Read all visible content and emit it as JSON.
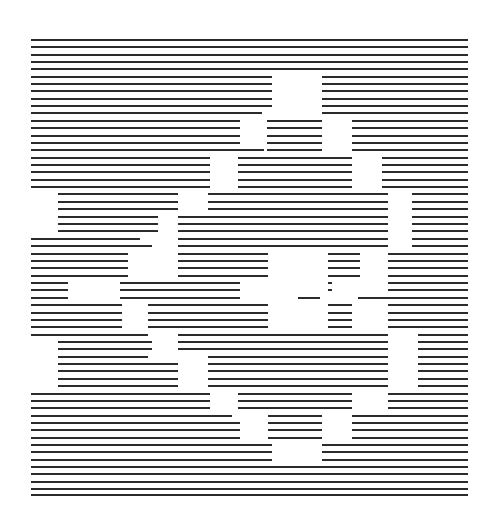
{
  "artwork": {
    "title": "Horizontal Line Field",
    "medium": "generative line drawing",
    "type": "abstract-line-raster",
    "description": "A field of evenly spaced horizontal ink rules spanning a square region, interrupted by rectangular voids aligned to an underlying grid, producing a blocky positive/negative pattern.",
    "background_color": "#ffffff",
    "line_color": "#2b2b2b",
    "canvas": {
      "width": 498,
      "height": 521
    }
  },
  "line_field": {
    "left_margin": 31,
    "right_margin": 468,
    "top_line_y": 40,
    "bottom_line_y": 495,
    "line_count": 63,
    "line_spacing": 7.34,
    "stroke_width": 1.55,
    "grid_column_step": 50,
    "grid_origin_x": 31,
    "rows": [
      {
        "y": 40,
        "spans": [
          [
            31,
            468
          ]
        ]
      },
      {
        "y": 47,
        "spans": [
          [
            31,
            468
          ]
        ]
      },
      {
        "y": 55,
        "spans": [
          [
            31,
            468
          ]
        ]
      },
      {
        "y": 62,
        "spans": [
          [
            31,
            468
          ]
        ]
      },
      {
        "y": 69,
        "spans": [
          [
            31,
            468
          ]
        ]
      },
      {
        "y": 77,
        "spans": [
          [
            31,
            272
          ],
          [
            322,
            468
          ]
        ]
      },
      {
        "y": 84,
        "spans": [
          [
            31,
            272
          ],
          [
            322,
            468
          ]
        ]
      },
      {
        "y": 91,
        "spans": [
          [
            31,
            272
          ],
          [
            322,
            468
          ]
        ]
      },
      {
        "y": 99,
        "spans": [
          [
            31,
            272
          ],
          [
            322,
            468
          ]
        ]
      },
      {
        "y": 106,
        "spans": [
          [
            31,
            272
          ],
          [
            322,
            468
          ]
        ]
      },
      {
        "y": 113,
        "spans": [
          [
            31,
            262
          ],
          [
            322,
            468
          ]
        ]
      },
      {
        "y": 121,
        "spans": [
          [
            31,
            240
          ],
          [
            267,
            322
          ],
          [
            352,
            468
          ]
        ]
      },
      {
        "y": 128,
        "spans": [
          [
            31,
            240
          ],
          [
            267,
            322
          ],
          [
            352,
            468
          ]
        ]
      },
      {
        "y": 136,
        "spans": [
          [
            31,
            240
          ],
          [
            267,
            322
          ],
          [
            352,
            468
          ]
        ]
      },
      {
        "y": 143,
        "spans": [
          [
            31,
            240
          ],
          [
            267,
            322
          ],
          [
            352,
            468
          ]
        ]
      },
      {
        "y": 150,
        "spans": [
          [
            31,
            264
          ],
          [
            267,
            322
          ],
          [
            352,
            468
          ]
        ]
      },
      {
        "y": 158,
        "spans": [
          [
            31,
            210
          ],
          [
            238,
            352
          ],
          [
            382,
            468
          ]
        ]
      },
      {
        "y": 165,
        "spans": [
          [
            31,
            210
          ],
          [
            238,
            352
          ],
          [
            382,
            468
          ]
        ]
      },
      {
        "y": 172,
        "spans": [
          [
            31,
            210
          ],
          [
            238,
            352
          ],
          [
            382,
            468
          ]
        ]
      },
      {
        "y": 180,
        "spans": [
          [
            31,
            210
          ],
          [
            238,
            352
          ],
          [
            382,
            468
          ]
        ]
      },
      {
        "y": 187,
        "spans": [
          [
            31,
            210
          ],
          [
            238,
            352
          ],
          [
            382,
            468
          ]
        ]
      },
      {
        "y": 194,
        "spans": [
          [
            58,
            178
          ],
          [
            208,
            388
          ],
          [
            412,
            468
          ]
        ]
      },
      {
        "y": 202,
        "spans": [
          [
            58,
            178
          ],
          [
            208,
            388
          ],
          [
            412,
            468
          ]
        ]
      },
      {
        "y": 209,
        "spans": [
          [
            58,
            178
          ],
          [
            208,
            388
          ],
          [
            412,
            468
          ]
        ]
      },
      {
        "y": 217,
        "spans": [
          [
            58,
            158
          ],
          [
            178,
            388
          ],
          [
            412,
            468
          ]
        ]
      },
      {
        "y": 224,
        "spans": [
          [
            58,
            158
          ],
          [
            178,
            388
          ],
          [
            412,
            468
          ]
        ]
      },
      {
        "y": 231,
        "spans": [
          [
            58,
            158
          ],
          [
            178,
            388
          ],
          [
            412,
            468
          ]
        ]
      },
      {
        "y": 239,
        "spans": [
          [
            31,
            140
          ],
          [
            178,
            388
          ],
          [
            412,
            468
          ]
        ]
      },
      {
        "y": 246,
        "spans": [
          [
            31,
            152
          ],
          [
            178,
            388
          ],
          [
            412,
            468
          ]
        ]
      },
      {
        "y": 254,
        "spans": [
          [
            31,
            128
          ],
          [
            178,
            268
          ],
          [
            328,
            360
          ],
          [
            388,
            468
          ]
        ]
      },
      {
        "y": 261,
        "spans": [
          [
            31,
            128
          ],
          [
            178,
            268
          ],
          [
            328,
            360
          ],
          [
            388,
            468
          ]
        ]
      },
      {
        "y": 268,
        "spans": [
          [
            31,
            128
          ],
          [
            178,
            268
          ],
          [
            328,
            360
          ],
          [
            388,
            468
          ]
        ]
      },
      {
        "y": 276,
        "spans": [
          [
            31,
            128
          ],
          [
            178,
            268
          ],
          [
            328,
            360
          ],
          [
            388,
            468
          ]
        ]
      },
      {
        "y": 283,
        "spans": [
          [
            31,
            68
          ],
          [
            120,
            240
          ],
          [
            328,
            332
          ],
          [
            388,
            468
          ]
        ]
      },
      {
        "y": 290,
        "spans": [
          [
            31,
            68
          ],
          [
            120,
            240
          ],
          [
            328,
            332
          ],
          [
            388,
            468
          ]
        ]
      },
      {
        "y": 298,
        "spans": [
          [
            31,
            68
          ],
          [
            120,
            240
          ],
          [
            298,
            320
          ],
          [
            358,
            468
          ]
        ]
      },
      {
        "y": 305,
        "spans": [
          [
            31,
            122
          ],
          [
            148,
            268
          ],
          [
            328,
            352
          ],
          [
            388,
            468
          ]
        ]
      },
      {
        "y": 313,
        "spans": [
          [
            31,
            122
          ],
          [
            148,
            268
          ],
          [
            328,
            352
          ],
          [
            388,
            468
          ]
        ]
      },
      {
        "y": 320,
        "spans": [
          [
            31,
            122
          ],
          [
            148,
            268
          ],
          [
            328,
            352
          ],
          [
            388,
            468
          ]
        ]
      },
      {
        "y": 327,
        "spans": [
          [
            31,
            122
          ],
          [
            148,
            268
          ],
          [
            328,
            352
          ],
          [
            388,
            468
          ]
        ]
      },
      {
        "y": 335,
        "spans": [
          [
            31,
            148
          ],
          [
            178,
            388
          ],
          [
            418,
            468
          ]
        ]
      },
      {
        "y": 342,
        "spans": [
          [
            58,
            152
          ],
          [
            178,
            388
          ],
          [
            418,
            468
          ]
        ]
      },
      {
        "y": 349,
        "spans": [
          [
            58,
            152
          ],
          [
            178,
            388
          ],
          [
            418,
            468
          ]
        ]
      },
      {
        "y": 357,
        "spans": [
          [
            58,
            148
          ],
          [
            208,
            388
          ],
          [
            418,
            468
          ]
        ]
      },
      {
        "y": 364,
        "spans": [
          [
            58,
            178
          ],
          [
            208,
            388
          ],
          [
            418,
            468
          ]
        ]
      },
      {
        "y": 371,
        "spans": [
          [
            58,
            178
          ],
          [
            208,
            388
          ],
          [
            418,
            468
          ]
        ]
      },
      {
        "y": 379,
        "spans": [
          [
            58,
            178
          ],
          [
            208,
            388
          ],
          [
            418,
            468
          ]
        ]
      },
      {
        "y": 386,
        "spans": [
          [
            58,
            178
          ],
          [
            208,
            388
          ],
          [
            418,
            468
          ]
        ]
      },
      {
        "y": 394,
        "spans": [
          [
            31,
            210
          ],
          [
            238,
            352
          ],
          [
            388,
            468
          ]
        ]
      },
      {
        "y": 401,
        "spans": [
          [
            31,
            210
          ],
          [
            238,
            352
          ],
          [
            388,
            468
          ]
        ]
      },
      {
        "y": 408,
        "spans": [
          [
            31,
            210
          ],
          [
            238,
            352
          ],
          [
            388,
            468
          ]
        ]
      },
      {
        "y": 416,
        "spans": [
          [
            31,
            232
          ],
          [
            268,
            322
          ],
          [
            352,
            468
          ]
        ]
      },
      {
        "y": 423,
        "spans": [
          [
            31,
            240
          ],
          [
            268,
            322
          ],
          [
            352,
            468
          ]
        ]
      },
      {
        "y": 430,
        "spans": [
          [
            31,
            240
          ],
          [
            268,
            322
          ],
          [
            352,
            468
          ]
        ]
      },
      {
        "y": 438,
        "spans": [
          [
            31,
            240
          ],
          [
            268,
            322
          ],
          [
            352,
            468
          ]
        ]
      },
      {
        "y": 445,
        "spans": [
          [
            31,
            272
          ],
          [
            322,
            468
          ]
        ]
      },
      {
        "y": 452,
        "spans": [
          [
            31,
            272
          ],
          [
            322,
            468
          ]
        ]
      },
      {
        "y": 460,
        "spans": [
          [
            31,
            272
          ],
          [
            322,
            468
          ]
        ]
      },
      {
        "y": 467,
        "spans": [
          [
            31,
            468
          ]
        ]
      },
      {
        "y": 474,
        "spans": [
          [
            31,
            468
          ]
        ]
      },
      {
        "y": 482,
        "spans": [
          [
            31,
            468
          ]
        ]
      },
      {
        "y": 489,
        "spans": [
          [
            31,
            468
          ]
        ]
      },
      {
        "y": 495,
        "spans": [
          [
            31,
            468
          ]
        ]
      }
    ]
  }
}
